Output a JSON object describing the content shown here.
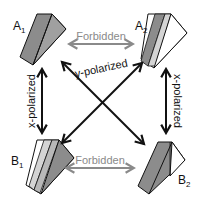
{
  "diagram": {
    "nodes": {
      "a1": {
        "label": "A",
        "sub": "1"
      },
      "a2": {
        "label": "A",
        "sub": "2"
      },
      "b1": {
        "label": "B",
        "sub": "1"
      },
      "b2": {
        "label": "B",
        "sub": "2"
      }
    },
    "edges": {
      "top": {
        "label": "Forbidden",
        "from": "A1",
        "to": "A2",
        "style": "gray double arrow"
      },
      "bottom": {
        "label": "Forbidden",
        "from": "B1",
        "to": "B2",
        "style": "gray double arrow"
      },
      "left": {
        "label": "x-polarized",
        "from": "A1",
        "to": "B1",
        "style": "black double arrow"
      },
      "right": {
        "label": "x-polarized",
        "from": "A2",
        "to": "B2",
        "style": "black double arrow"
      },
      "diagonal": {
        "label": "y-polarized",
        "style": "black crossed double arrows A1-B2 and A2-B1"
      }
    },
    "colors": {
      "forbidden_arrow": "#8a8a8a",
      "allowed_arrow": "#111111",
      "prism_dark": "#8c8c8c",
      "prism_mid": "#a8a8a8",
      "prism_light": "#d4d4d4",
      "prism_white": "#ffffff"
    }
  }
}
